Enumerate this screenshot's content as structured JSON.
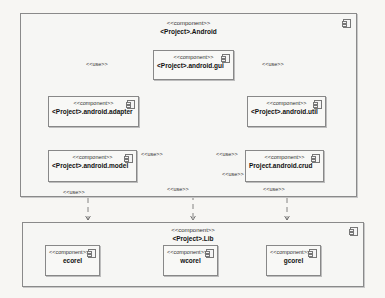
{
  "diagram": {
    "type": "UML component diagram",
    "containers": [
      {
        "id": "android",
        "stereotype": "<<component>>",
        "name": "<Project>.Android",
        "components": [
          {
            "id": "gui",
            "stereotype": "<<component>>",
            "name": "<Project>.android.gui"
          },
          {
            "id": "adapter",
            "stereotype": "<<component>>",
            "name": "<Project>.android.adapter"
          },
          {
            "id": "util",
            "stereotype": "<<component>>",
            "name": "<Project>.android.util"
          },
          {
            "id": "model",
            "stereotype": "<<component>>",
            "name": "<Project>.android.model"
          },
          {
            "id": "crud",
            "stereotype": "<<component>>",
            "name": "Project.android.crud"
          }
        ]
      },
      {
        "id": "lib",
        "stereotype": "<<component>>",
        "name": "<Project>.Lib",
        "components": [
          {
            "id": "ecorel",
            "stereotype": "<<component>>",
            "name": "ecorel"
          },
          {
            "id": "wcorel",
            "stereotype": "<<component>>",
            "name": "wcorel"
          },
          {
            "id": "gcorel",
            "stereotype": "<<component>>",
            "name": "gcorel"
          }
        ]
      }
    ],
    "edges": [
      {
        "from": "gui",
        "to": "adapter",
        "label": "<<use>>"
      },
      {
        "from": "gui",
        "to": "util",
        "label": "<<use>>"
      },
      {
        "from": "gui",
        "to": "model",
        "label": "<<use>>"
      },
      {
        "from": "gui",
        "to": "crud",
        "label": "<<use>>"
      },
      {
        "from": "crud",
        "to": "model",
        "label": "<<use>>"
      },
      {
        "from": "model",
        "to": "ecorel",
        "label": "<<use>>"
      },
      {
        "from": "gui",
        "to": "wcorel",
        "label": "<<use>>"
      },
      {
        "from": "crud",
        "to": "gcorel",
        "label": "<<use>>"
      }
    ]
  }
}
